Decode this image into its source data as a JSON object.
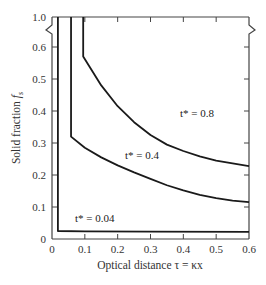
{
  "chart_data": {
    "type": "line",
    "title": "",
    "xlabel": "Optical distance τ = κx",
    "ylabel": "Solid fraction f_s",
    "xlim": [
      0,
      0.6
    ],
    "ylim": [
      0,
      1.0
    ],
    "y_axis_break": [
      0.6,
      1.0
    ],
    "x_ticks": [
      "0",
      "0.1",
      "0.2",
      "0.3",
      "0.4",
      "0.5",
      "0.6"
    ],
    "y_ticks": [
      "0",
      "0.1",
      "0.2",
      "0.3",
      "0.4",
      "0.5",
      "0.6",
      "1.0"
    ],
    "grid": false,
    "series": [
      {
        "name": "t* = 0.8",
        "label": "t* = 0.8",
        "points": [
          [
            0.095,
            1.0
          ],
          [
            0.095,
            0.57
          ],
          [
            0.15,
            0.48
          ],
          [
            0.2,
            0.415
          ],
          [
            0.25,
            0.365
          ],
          [
            0.3,
            0.325
          ],
          [
            0.35,
            0.295
          ],
          [
            0.4,
            0.275
          ],
          [
            0.45,
            0.258
          ],
          [
            0.5,
            0.245
          ],
          [
            0.55,
            0.236
          ],
          [
            0.6,
            0.228
          ]
        ]
      },
      {
        "name": "t* = 0.4",
        "label": "t* = 0.4",
        "points": [
          [
            0.058,
            1.0
          ],
          [
            0.058,
            0.32
          ],
          [
            0.1,
            0.285
          ],
          [
            0.15,
            0.255
          ],
          [
            0.2,
            0.23
          ],
          [
            0.25,
            0.208
          ],
          [
            0.3,
            0.188
          ],
          [
            0.35,
            0.168
          ],
          [
            0.4,
            0.152
          ],
          [
            0.45,
            0.138
          ],
          [
            0.5,
            0.128
          ],
          [
            0.55,
            0.12
          ],
          [
            0.6,
            0.115
          ]
        ]
      },
      {
        "name": "t* = 0.04",
        "label": "t* = 0.04",
        "points": [
          [
            0.018,
            1.0
          ],
          [
            0.018,
            0.025
          ],
          [
            0.1,
            0.024
          ],
          [
            0.3,
            0.023
          ],
          [
            0.6,
            0.022
          ]
        ]
      }
    ]
  },
  "labels": {
    "x_axis": "Optical distance τ = κx",
    "y_axis_main": "Solid fraction ",
    "y_axis_sym": "f",
    "y_axis_sub": "s",
    "curve_08": "t* = 0.8",
    "curve_04": "t* = 0.4",
    "curve_004": "t* = 0.04"
  }
}
